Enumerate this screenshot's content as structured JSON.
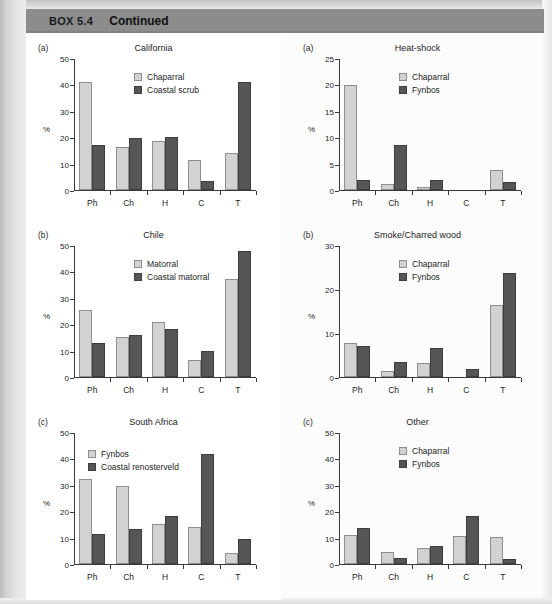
{
  "header": {
    "box_number": "BOX 5.4",
    "continued_label": "Continued",
    "bar_color": "#8c8c8c"
  },
  "colors": {
    "series_light": "#d2d2d2",
    "series_dark": "#565656",
    "axis": "#3a3a3a",
    "panel_background": "#ffffff"
  },
  "axis_common": {
    "ylabel": "%",
    "categories": [
      "Ph",
      "Ch",
      "H",
      "C",
      "T"
    ]
  },
  "chart_data": [
    {
      "id": "california",
      "type": "bar",
      "panel_label": "(a)",
      "title": "California",
      "column": "left",
      "xlabel": "",
      "ylabel": "%",
      "ylim": [
        0,
        50
      ],
      "yticks": [
        0,
        10,
        20,
        30,
        40,
        50
      ],
      "grid": false,
      "legend_position": "top-center",
      "categories": [
        "Ph",
        "Ch",
        "H",
        "C",
        "T"
      ],
      "series": [
        {
          "name": "Chaparral",
          "color": "#d2d2d2",
          "values": [
            41.0,
            16.3,
            18.5,
            11.2,
            14.0
          ]
        },
        {
          "name": "Coastal scrub",
          "color": "#565656",
          "values": [
            17.1,
            19.6,
            20.1,
            3.4,
            41.0
          ]
        }
      ]
    },
    {
      "id": "chile",
      "type": "bar",
      "panel_label": "(b)",
      "title": "Chile",
      "column": "left",
      "xlabel": "",
      "ylabel": "%",
      "ylim": [
        0,
        50
      ],
      "yticks": [
        0,
        10,
        20,
        30,
        40,
        50
      ],
      "grid": false,
      "legend_position": "top-center",
      "categories": [
        "Ph",
        "Ch",
        "H",
        "C",
        "T"
      ],
      "series": [
        {
          "name": "Matorral",
          "color": "#d2d2d2",
          "values": [
            25.2,
            15.0,
            21.0,
            6.6,
            37.0
          ]
        },
        {
          "name": "Coastal matorral",
          "color": "#565656",
          "values": [
            13.0,
            16.0,
            18.0,
            10.0,
            47.7
          ]
        }
      ]
    },
    {
      "id": "south-africa",
      "type": "bar",
      "panel_label": "(c)",
      "title": "South Africa",
      "column": "left",
      "xlabel": "",
      "ylabel": "%",
      "ylim": [
        0,
        50
      ],
      "yticks": [
        0,
        10,
        20,
        30,
        40,
        50
      ],
      "grid": false,
      "legend_position": "top-left",
      "categories": [
        "Ph",
        "Ch",
        "H",
        "C",
        "T"
      ],
      "series": [
        {
          "name": "Fynbos",
          "color": "#d2d2d2",
          "values": [
            32.1,
            29.4,
            15.3,
            14.1,
            4.0
          ]
        },
        {
          "name": "Coastal renosterveld",
          "color": "#565656",
          "values": [
            11.4,
            13.4,
            18.1,
            41.7,
            9.3
          ]
        }
      ]
    },
    {
      "id": "heat-shock",
      "type": "bar",
      "panel_label": "(a)",
      "title": "Heat-shock",
      "column": "right",
      "xlabel": "",
      "ylabel": "%",
      "ylim": [
        0,
        25
      ],
      "yticks": [
        0,
        5,
        10,
        15,
        20,
        25
      ],
      "grid": false,
      "legend_position": "top-center",
      "categories": [
        "Ph",
        "Ch",
        "H",
        "C",
        "T"
      ],
      "series": [
        {
          "name": "Chaparral",
          "color": "#d2d2d2",
          "values": [
            19.9,
            1.2,
            0.5,
            0.0,
            3.7
          ]
        },
        {
          "name": "Fynbos",
          "color": "#565656",
          "values": [
            1.9,
            8.5,
            1.9,
            0.0,
            1.6
          ]
        }
      ]
    },
    {
      "id": "smoke-charred-wood",
      "type": "bar",
      "panel_label": "(b)",
      "title": "Smoke/Charred wood",
      "column": "right",
      "xlabel": "",
      "ylabel": "%",
      "ylim": [
        0,
        30
      ],
      "yticks": [
        0,
        10,
        20,
        30
      ],
      "grid": false,
      "legend_position": "top-center",
      "categories": [
        "Ph",
        "Ch",
        "H",
        "C",
        "T"
      ],
      "series": [
        {
          "name": "Chaparral",
          "color": "#d2d2d2",
          "values": [
            7.7,
            1.3,
            3.1,
            0.0,
            16.3
          ]
        },
        {
          "name": "Fynbos",
          "color": "#565656",
          "values": [
            7.0,
            3.4,
            6.6,
            1.8,
            23.7
          ]
        }
      ]
    },
    {
      "id": "other",
      "type": "bar",
      "panel_label": "(c)",
      "title": "Other",
      "column": "right",
      "xlabel": "",
      "ylabel": "%",
      "ylim": [
        0,
        50
      ],
      "yticks": [
        0,
        10,
        20,
        30,
        40,
        50
      ],
      "grid": false,
      "legend_position": "top-center",
      "categories": [
        "Ph",
        "Ch",
        "H",
        "C",
        "T"
      ],
      "series": [
        {
          "name": "Chaparral",
          "color": "#d2d2d2",
          "values": [
            11.0,
            4.6,
            6.1,
            10.8,
            10.2
          ]
        },
        {
          "name": "Fynbos",
          "color": "#565656",
          "values": [
            13.7,
            2.1,
            6.9,
            18.3,
            1.9
          ]
        }
      ]
    }
  ]
}
